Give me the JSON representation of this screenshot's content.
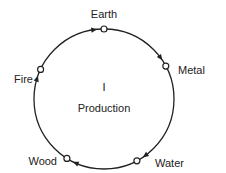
{
  "diagram": {
    "title_numeral": "I",
    "title": "Production",
    "direction": "clockwise",
    "cycle": [
      {
        "id": "earth",
        "label": "Earth"
      },
      {
        "id": "metal",
        "label": "Metal"
      },
      {
        "id": "water",
        "label": "Water"
      },
      {
        "id": "wood",
        "label": "Wood"
      },
      {
        "id": "fire",
        "label": "Fire"
      }
    ],
    "colors": {
      "line": "#222222",
      "node_fill": "#ffffff",
      "text": "#222222"
    }
  }
}
